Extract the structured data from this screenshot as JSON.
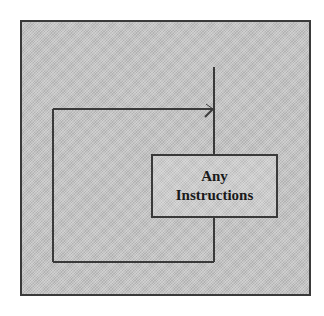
{
  "diagram": {
    "type": "flowchart-loop",
    "colors": {
      "background": "#c6c6c6",
      "line": "#3a3a3a",
      "text": "#1a1a1a"
    },
    "nodes": [
      {
        "id": "any-instructions",
        "shape": "rectangle",
        "lines": [
          "Any",
          "Instructions"
        ]
      }
    ],
    "edges": [
      {
        "from": "entry",
        "to": "any-instructions",
        "description": "vertical line entering from top into box"
      },
      {
        "from": "any-instructions",
        "to": "loop-back",
        "description": "line exits bottom of box, goes down, left, up, and right with arrow back to main flow"
      }
    ]
  }
}
